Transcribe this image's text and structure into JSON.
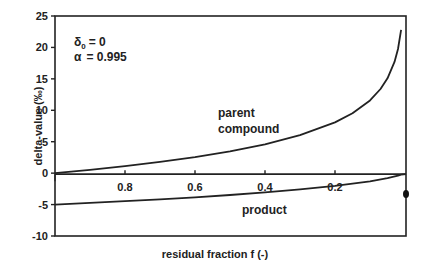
{
  "chart_data": {
    "type": "line",
    "title": "",
    "xlabel": "residual fraction f (-)",
    "ylabel": "delta-value (‰)",
    "xlim": [
      1.0,
      0.0
    ],
    "ylim": [
      -10,
      25
    ],
    "x_reversed": true,
    "grid": false,
    "x_ticks": [
      0.8,
      0.6,
      0.4,
      0.2
    ],
    "x_tick_labels": [
      "0.8",
      "0.6",
      "0.4",
      "0.2"
    ],
    "y_ticks": [
      25,
      20,
      15,
      10,
      5,
      0,
      -5,
      -10
    ],
    "y_tick_labels": [
      "25",
      "20",
      "15",
      "10",
      "5",
      "0",
      "-5",
      "-10"
    ],
    "parameters": {
      "delta0_label": "δ",
      "delta0_sub": "0",
      "delta0_value": "= 0",
      "alpha_label": "α",
      "alpha_value": "= 0.995"
    },
    "series": [
      {
        "name": "parent compound",
        "x": [
          1.0,
          0.9,
          0.8,
          0.7,
          0.6,
          0.5,
          0.4,
          0.3,
          0.2,
          0.15,
          0.1,
          0.07,
          0.05,
          0.03,
          0.02,
          0.011
        ],
        "values": [
          0.0,
          0.53,
          1.12,
          1.79,
          2.56,
          3.47,
          4.59,
          6.04,
          8.08,
          9.53,
          11.58,
          13.39,
          15.09,
          17.69,
          19.75,
          22.8
        ]
      },
      {
        "name": "product",
        "x": [
          1.0,
          0.9,
          0.8,
          0.7,
          0.6,
          0.5,
          0.4,
          0.3,
          0.2,
          0.1,
          0.05,
          0.02,
          0.011
        ],
        "values": [
          -5.0,
          -4.74,
          -4.47,
          -4.18,
          -3.84,
          -3.47,
          -3.06,
          -2.59,
          -2.02,
          -1.29,
          -0.79,
          -0.4,
          -0.25
        ]
      }
    ],
    "annotations": [
      {
        "text": "parent",
        "x": 0.43,
        "y": 9.5
      },
      {
        "text": "compound",
        "x": 0.43,
        "y": 6.8
      },
      {
        "text": "product",
        "x": 0.42,
        "y": -6.8
      }
    ],
    "markers": [
      {
        "name": "end-point",
        "x": 0.0,
        "y": -3.0
      }
    ],
    "legend": "none"
  }
}
